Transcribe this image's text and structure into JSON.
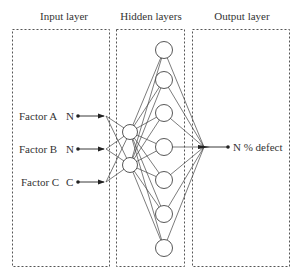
{
  "diagram": {
    "layers": [
      {
        "id": "input",
        "label": "Input layer"
      },
      {
        "id": "hidden",
        "label": "Hidden layers"
      },
      {
        "id": "output",
        "label": "Output layer"
      }
    ],
    "inputs": [
      {
        "name": "Factor A",
        "type": "N"
      },
      {
        "name": "Factor B",
        "type": "N"
      },
      {
        "name": "Factor C",
        "type": "C"
      }
    ],
    "hidden_layer_1_nodes": 2,
    "hidden_layer_2_nodes": 7,
    "output": {
      "type": "N",
      "name": "% defect",
      "label": "N % defect"
    },
    "colors": {
      "line": "#444444",
      "box": "#555555",
      "text": "#333333",
      "background": "#ffffff"
    }
  }
}
